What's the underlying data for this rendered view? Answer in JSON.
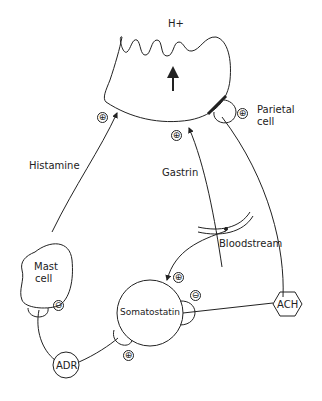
{
  "diagram": {
    "labels": {
      "proton": "H+",
      "parietal_cell": "Parietal cell",
      "parietal_line1": "Parietal",
      "parietal_line2": "cell",
      "histamine": "Histamine",
      "gastrin": "Gastrin",
      "bloodstream": "Bloodstream",
      "mast_cell_line1": "Mast",
      "mast_cell_line2": "cell",
      "somatostatin": "Somatostatin",
      "adr": "ADR",
      "ach": "ACH"
    },
    "signs": {
      "histamine_to_parietal": "⊕",
      "gastrin_to_parietal": "⊕",
      "ach_to_parietal": "⊕",
      "gastrin_to_somatostatin": "⊕",
      "somatostatin_inhibits_mast": "⊖",
      "ach_to_somatostatin": "⊖",
      "adr_to_somatostatin": "⊕"
    },
    "stroke_color": "#222222",
    "background": "#ffffff"
  }
}
